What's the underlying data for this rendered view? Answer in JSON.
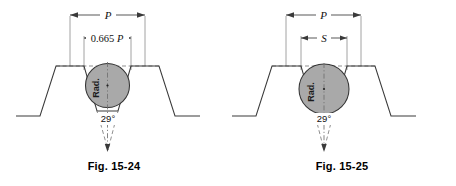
{
  "page": {
    "background": "#ffffff",
    "ink": "#3a3a3a",
    "fill_gray": "#a9a9a9"
  },
  "figures": [
    {
      "id": "fig-15-24",
      "caption": "Fig. 15-24",
      "pitch_label": "P",
      "width_label_prefix": "0.665",
      "width_label_suffix": "P",
      "width_label_full": "0.665 P",
      "angle_label": "29°",
      "circle_label": "Rad.",
      "circle_fill": "#a9a9a9",
      "thread_form": "acme",
      "included_angle_deg": 29,
      "circle_position": "tangent-to-flanks-upper"
    },
    {
      "id": "fig-15-25",
      "caption": "Fig. 15-25",
      "pitch_label": "P",
      "width_label_full": "S",
      "angle_label": "29°",
      "circle_label": "Rad.",
      "circle_fill": "#a9a9a9",
      "thread_form": "acme",
      "included_angle_deg": 29,
      "circle_position": "seated-in-groove"
    }
  ]
}
